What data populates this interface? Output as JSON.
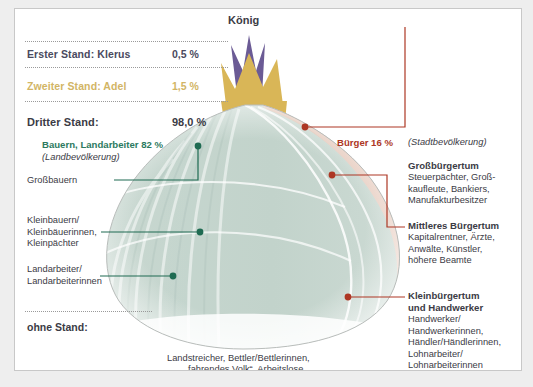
{
  "diagram": {
    "title_top": "König",
    "colors": {
      "clergy_purple": "#6b5b95",
      "nobility_gold": "#d9b657",
      "peasant_green": "#c5d5ce",
      "bourgeois_pink": "#e3c5b6",
      "green_text": "#2c7a60",
      "red_text": "#ad3724",
      "gold_text": "#d2b565",
      "dark_text": "#3b3b45"
    }
  },
  "stands": [
    {
      "label": "Erster Stand: Klerus",
      "pct": "0,5 %"
    },
    {
      "label": "Zweiter Stand: Adel",
      "pct": "1,5 %"
    },
    {
      "label": "Dritter Stand:",
      "pct": "98,0 %"
    }
  ],
  "left": {
    "rural_headline": "Bauern, Landarbeiter 82 %",
    "rural_sub": "(Landbevölkerung)",
    "callouts": [
      {
        "label": "Großbauern"
      },
      {
        "label": "Kleinbauern/\nKleinbäuerinnen,\nKleinpächter"
      },
      {
        "label": "Landarbeiter/\nLandarbeiterinnen"
      }
    ],
    "ohne_stand": "ohne Stand:"
  },
  "right": {
    "buerger_headline": "Bürger 16 %",
    "buerger_sub": "(Stadtbevölkerung)",
    "groups": [
      {
        "title": "Großbürgertum",
        "body": "Steuerpächter, Groß-\nkaufleute, Bankiers,\nManufakturbesitzer"
      },
      {
        "title": "Mittleres Bürgertum",
        "body": "Kapitalrentner, Ärzte,\nAnwälte, Künstler,\nhöhere Beamte"
      },
      {
        "title": "Kleinbürgertum\nund Handwerker",
        "body": "Handwerker/\nHandwerkerinnen,\nHändler/Händlerinnen,\nLohnarbeiter/\nLohnarbeiterinnen"
      }
    ]
  },
  "bottom": {
    "line1": "Landstreicher, Bettler/Bettlerinnen,",
    "line2": "„fahrendes Volk“, Arbeitslose"
  }
}
